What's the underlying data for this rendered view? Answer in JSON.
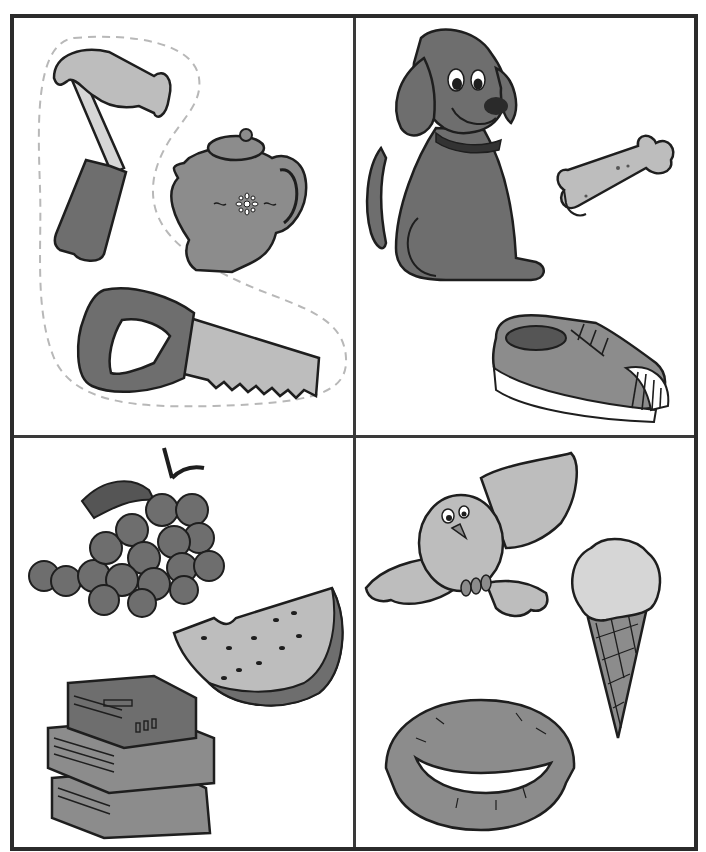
{
  "worksheet": {
    "layout": "2x2 grid",
    "colors": {
      "border": "#2b2b2b",
      "outline": "#1e1e1e",
      "dark_fill": "#6e6e6e",
      "mid_fill": "#8c8c8c",
      "light_fill": "#bdbdbd",
      "pale_fill": "#d6d6d6",
      "dashed_outline": "#b8b8b8"
    },
    "panels": [
      {
        "position": "top-left",
        "items": [
          "hammer",
          "teapot",
          "saw"
        ],
        "grouped_with_dashed_outline": [
          "hammer",
          "saw"
        ]
      },
      {
        "position": "top-right",
        "items": [
          "dog",
          "dog-bone",
          "sneaker"
        ]
      },
      {
        "position": "bottom-left",
        "items": [
          "grapes",
          "watermelon-slice",
          "stack-of-books"
        ]
      },
      {
        "position": "bottom-right",
        "items": [
          "bird",
          "ice-cream-cone",
          "nest-with-eggs"
        ]
      }
    ]
  }
}
